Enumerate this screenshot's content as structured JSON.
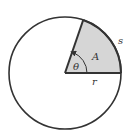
{
  "diagram": {
    "type": "circle-sector",
    "labels": {
      "arc_length": "s",
      "area": "A",
      "angle": "θ",
      "radius": "r"
    },
    "geometry": {
      "center": [
        65,
        73
      ],
      "radius": 56,
      "sector_start_deg": 0,
      "sector_end_deg": 71
    },
    "colors": {
      "stroke": "#333333",
      "sector_fill": "#d6d6d6",
      "background": "#ffffff"
    }
  }
}
